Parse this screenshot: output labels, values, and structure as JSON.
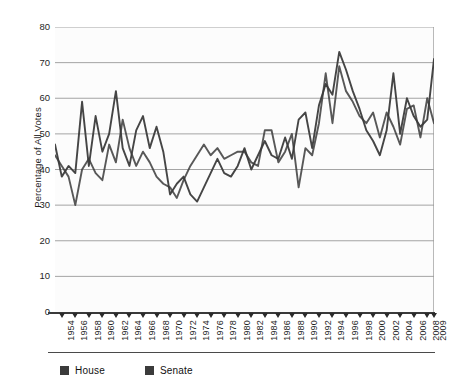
{
  "chart_data": {
    "type": "line",
    "title": "",
    "xlabel": "",
    "ylabel": "Percentage of All Votes",
    "ylim": [
      0,
      80
    ],
    "ytick_step": 10,
    "yticks": [
      0,
      10,
      20,
      30,
      40,
      50,
      60,
      70,
      80
    ],
    "grid": true,
    "grid_axis": "y",
    "legend_position": "bottom-left",
    "xlim": [
      1953,
      2009
    ],
    "xtick_labels": [
      "1954",
      "1956",
      "1958",
      "1960",
      "1962",
      "1964",
      "1966",
      "1968",
      "1970",
      "1972",
      "1974",
      "1976",
      "1978",
      "1980",
      "1982",
      "1984",
      "1986",
      "1988",
      "1990",
      "1992",
      "1994",
      "1996",
      "1998",
      "2000",
      "2002",
      "2004",
      "2006",
      "2008",
      "2009"
    ],
    "x": [
      1953,
      1954,
      1955,
      1956,
      1957,
      1958,
      1959,
      1960,
      1961,
      1962,
      1963,
      1964,
      1965,
      1966,
      1967,
      1968,
      1969,
      1970,
      1971,
      1972,
      1973,
      1974,
      1975,
      1976,
      1977,
      1978,
      1979,
      1980,
      1981,
      1982,
      1983,
      1984,
      1985,
      1986,
      1987,
      1988,
      1989,
      1990,
      1991,
      1992,
      1993,
      1994,
      1995,
      1996,
      1997,
      1998,
      1999,
      2000,
      2001,
      2002,
      2003,
      2004,
      2005,
      2006,
      2007,
      2008,
      2009
    ],
    "series": [
      {
        "name": "House",
        "color": "#3b3b3b",
        "values": [
          47,
          38,
          41,
          39,
          59,
          41,
          55,
          45,
          50,
          62,
          46,
          41,
          51,
          55,
          46,
          52,
          45,
          33,
          36,
          38,
          33,
          31,
          35,
          39,
          43,
          39,
          38,
          41,
          46,
          40,
          44,
          48,
          44,
          43,
          49,
          43,
          54,
          56,
          46,
          58,
          64,
          61,
          73,
          68,
          62,
          57,
          51,
          48,
          44,
          51,
          67,
          50,
          60,
          55,
          52,
          54,
          71
        ]
      },
      {
        "name": "Senate",
        "color": "#3b3b3b",
        "values": [
          44,
          41,
          38,
          30,
          40,
          43,
          39,
          37,
          47,
          42,
          54,
          46,
          41,
          45,
          42,
          38,
          36,
          35,
          32,
          37,
          41,
          44,
          47,
          44,
          46,
          43,
          44,
          45,
          45,
          42,
          41,
          51,
          51,
          42,
          45,
          50,
          35,
          46,
          44,
          53,
          67,
          53,
          69,
          62,
          59,
          55,
          53,
          56,
          49,
          56,
          52,
          47,
          57,
          58,
          49,
          60,
          53
        ]
      }
    ],
    "annotations": []
  },
  "legend": {
    "items": [
      {
        "label": "House",
        "color": "#3b3b3b",
        "swatch": "square-marker"
      },
      {
        "label": "Senate",
        "color": "#3b3b3b",
        "swatch": "square-marker"
      }
    ]
  },
  "axes": {
    "y_title": "Percentage of All Votes"
  },
  "colors": {
    "line": "#3b3b3b",
    "grid": "#9a9a9a",
    "axis": "#3a3a3a",
    "plot_background": "#fcfcfc",
    "page_background": "#ffffff"
  }
}
